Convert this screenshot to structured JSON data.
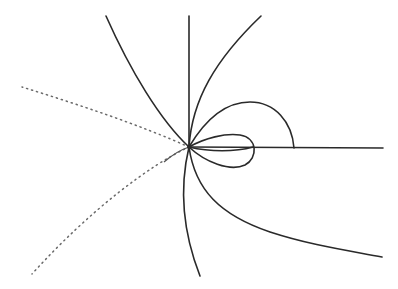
{
  "diagram": {
    "type": "phase-portrait-curves",
    "origin": {
      "x": 189,
      "y": 147
    },
    "colors": {
      "stroke": "#2a2a2a",
      "dotted": "#6a6a6a",
      "background": "#ffffff"
    },
    "elements": [
      {
        "id": "vertical-ray",
        "style": "solid",
        "path": "M189,147 L189,16"
      },
      {
        "id": "horizontal-ray",
        "style": "solid",
        "path": "M189,147 L383,148"
      },
      {
        "id": "upper-right-branch",
        "style": "solid",
        "path": "M189,147 C192,100 215,60 261,16"
      },
      {
        "id": "large-loop",
        "style": "solid",
        "path": "M189,147 C205,120 225,102 250,102 C275,102 292,122 294,148"
      },
      {
        "id": "small-loop",
        "style": "solid",
        "path": "M189,147 C205,138 225,133 240,135 C258,138 258,158 245,165 C230,172 205,162 189,147"
      },
      {
        "id": "small-loop-inner",
        "style": "solid",
        "path": "M189,147 C210,152 235,152 253,147"
      },
      {
        "id": "lower-right-branch",
        "style": "solid",
        "path": "M189,147 C195,190 220,215 270,232 C310,245 345,250 382,257"
      },
      {
        "id": "bottom-branch",
        "style": "solid",
        "path": "M189,147 C180,185 182,230 200,276"
      },
      {
        "id": "upper-left-branch",
        "style": "solid",
        "path": "M189,147 C160,120 130,70 106,16"
      },
      {
        "id": "left-dotted-ray",
        "style": "dotted",
        "path": "M189,147 C140,125 80,105 22,87"
      },
      {
        "id": "lower-left-dotted-branch",
        "style": "dotted",
        "path": "M189,147 C150,165 90,210 32,274"
      },
      {
        "id": "left-short-branch",
        "style": "solid",
        "path": "M189,147 C180,150 172,155 164,162"
      }
    ]
  }
}
